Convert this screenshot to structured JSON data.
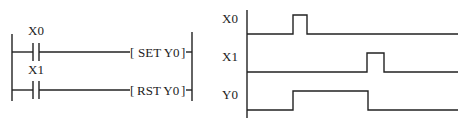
{
  "ladder": {
    "rungs": [
      {
        "contact": "X0",
        "coil": "SET Y0"
      },
      {
        "contact": "X1",
        "coil": "RST Y0"
      }
    ]
  },
  "timing": {
    "signals": [
      {
        "label": "X0"
      },
      {
        "label": "X1"
      },
      {
        "label": "Y0"
      }
    ]
  },
  "colors": {
    "line": "#222222",
    "background": "#ffffff"
  }
}
